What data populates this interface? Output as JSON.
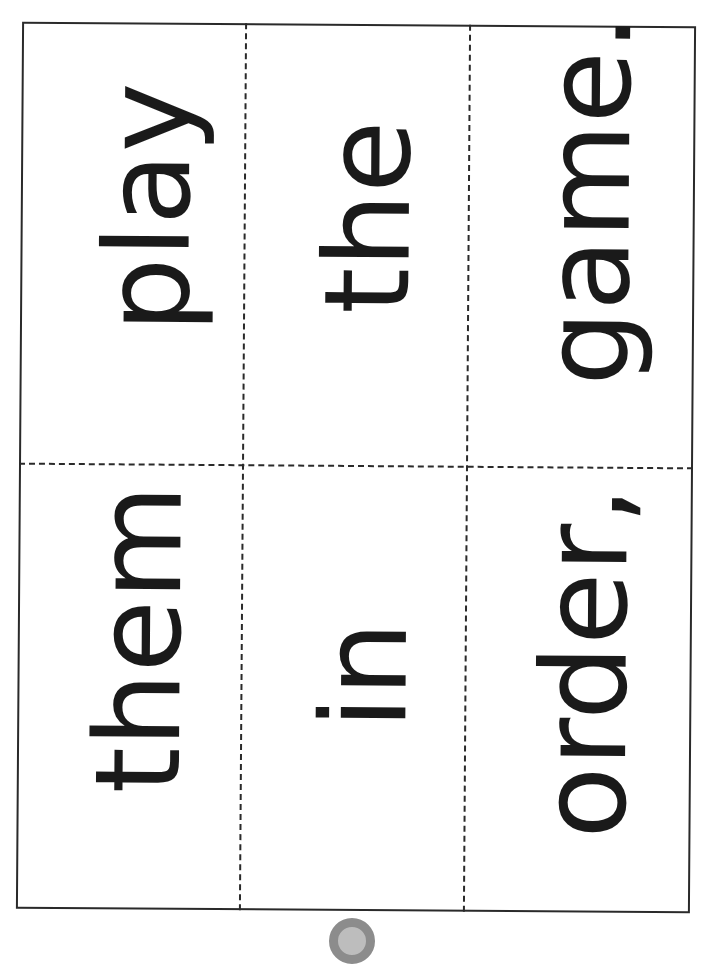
{
  "worksheet": {
    "title": "Sentence word cards",
    "layout": {
      "columns": 3,
      "rows": 2,
      "orientation": "rotated-90-ccw"
    },
    "cards": [
      {
        "id": "top-left",
        "row": 0,
        "col": 0,
        "word": "play"
      },
      {
        "id": "top-middle",
        "row": 0,
        "col": 1,
        "word": "the"
      },
      {
        "id": "top-right",
        "row": 0,
        "col": 2,
        "word": "game."
      },
      {
        "id": "bottom-left",
        "row": 1,
        "col": 0,
        "word": "them"
      },
      {
        "id": "bottom-middle",
        "row": 1,
        "col": 1,
        "word": "in"
      },
      {
        "id": "bottom-right",
        "row": 1,
        "col": 2,
        "word": "order,"
      }
    ],
    "colors": {
      "ink": "#1a1a1a",
      "border": "#2a2a2a",
      "hole": "#8c8c8c",
      "background": "#ffffff"
    }
  }
}
